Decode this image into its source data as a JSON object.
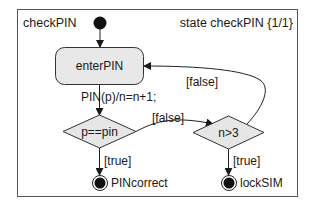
{
  "diagram": {
    "frame_name": "checkPIN",
    "frame_title": "state checkPIN {1/1}",
    "states": {
      "enter_pin": "enterPIN"
    },
    "choices": {
      "compare": "p==pin",
      "count": "n>3"
    },
    "final_states": {
      "correct": "PINcorrect",
      "lock": "lockSIM"
    },
    "transitions": {
      "enter_to_compare": "PIN(p)/n=n+1;",
      "compare_false": "[false]",
      "compare_true": "[true]",
      "count_false": "[false]",
      "count_true": "[true]"
    },
    "colors": {
      "stroke": "#333333",
      "fill": "#e6e6e6",
      "text": "#1a1a1a"
    }
  }
}
